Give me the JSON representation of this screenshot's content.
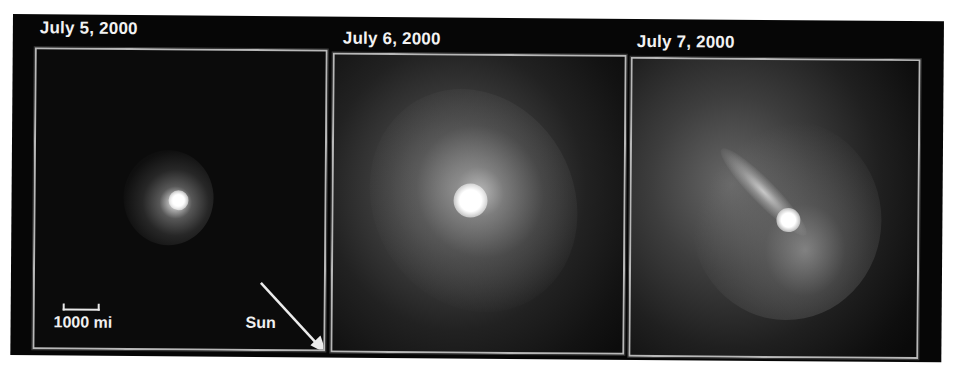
{
  "figure": {
    "background_color": "#060606",
    "border_color": "#b8b8b8",
    "panels": [
      {
        "date": "July 5, 2000",
        "scale_bar_label": "1000 mi",
        "sun_label": "Sun",
        "description": "Comet nucleus with compact round coma"
      },
      {
        "date": "July 6, 2000",
        "description": "Comet with large diffuse coma, bright core"
      },
      {
        "date": "July 7, 2000",
        "description": "Comet with elongated streak extending up-left from bright core"
      }
    ]
  }
}
